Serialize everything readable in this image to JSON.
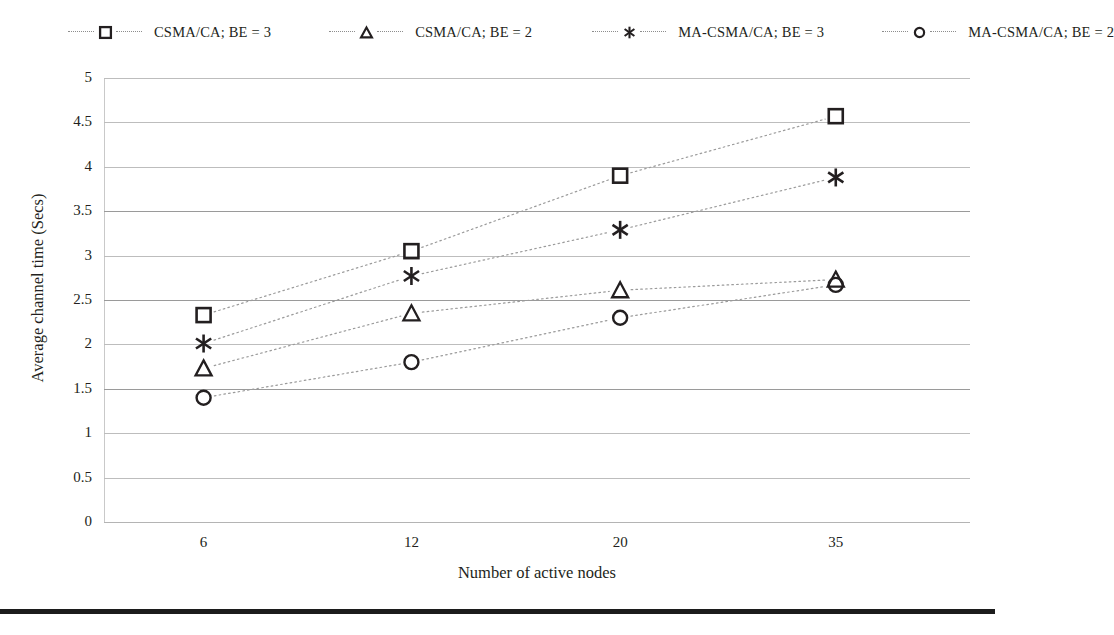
{
  "chart_data": {
    "type": "line",
    "title": "",
    "xlabel": "Number of active nodes",
    "ylabel": "Average channel time (Secs)",
    "categories": [
      "6",
      "12",
      "20",
      "35"
    ],
    "x": [
      6,
      12,
      20,
      35
    ],
    "ylim": [
      0,
      5
    ],
    "ytick_labels": [
      "0",
      "0.5",
      "1",
      "1.5",
      "2",
      "2.5",
      "3",
      "3.5",
      "4",
      "4.5",
      "5"
    ],
    "ytick_values": [
      0,
      0.5,
      1,
      1.5,
      2,
      2.5,
      3,
      3.5,
      4,
      4.5,
      5
    ],
    "grid": true,
    "legend_position": "top",
    "series": [
      {
        "name": "CSMA/CA; BE = 3",
        "marker": "square",
        "values": [
          2.33,
          3.05,
          3.9,
          4.57
        ]
      },
      {
        "name": "CSMA/CA; BE = 2",
        "marker": "triangle",
        "values": [
          1.73,
          2.35,
          2.61,
          2.73
        ]
      },
      {
        "name": "MA-CSMA/CA; BE = 3",
        "marker": "asterisk",
        "values": [
          2.01,
          2.77,
          3.29,
          3.88
        ]
      },
      {
        "name": "MA-CSMA/CA; BE = 2",
        "marker": "circle",
        "values": [
          1.4,
          1.8,
          2.3,
          2.67
        ]
      }
    ]
  },
  "legend": {
    "items": [
      {
        "label": "CSMA/CA; BE = 3",
        "marker": "square-marker-icon"
      },
      {
        "label": "CSMA/CA; BE = 2",
        "marker": "triangle-marker-icon"
      },
      {
        "label": "MA-CSMA/CA; BE = 3",
        "marker": "asterisk-marker-icon"
      },
      {
        "label": "MA-CSMA/CA; BE = 2",
        "marker": "circle-marker-icon"
      }
    ]
  },
  "colors": {
    "marker": "#231f20",
    "gridline": "#bdbdbd",
    "gridline_major": "#9a9a9a",
    "series_line": "#9b9b9b",
    "text": "#231f20",
    "rule": "#1c1c1c",
    "background": "#ffffff"
  }
}
